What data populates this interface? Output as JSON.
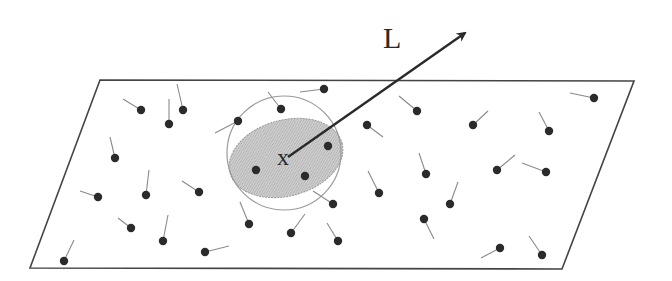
{
  "diagram": {
    "labels": {
      "vector": "L",
      "point": "x"
    },
    "colors": {
      "outline": "#444444",
      "dot": "#2b2b2b",
      "tail": "#8a8a8a",
      "circle": "#9a9a9a",
      "ellipse_fill": "#c4c4c4",
      "ellipse_stroke": "#9a9a9a",
      "arrow": "#2a2a2a"
    },
    "plane": {
      "points": [
        [
          100,
          80
        ],
        [
          634,
          81
        ],
        [
          562,
          269
        ],
        [
          30,
          268
        ]
      ]
    },
    "circle": {
      "cx": 284,
      "cy": 153,
      "r": 57
    },
    "ellipse": {
      "cx": 286,
      "cy": 158,
      "rx": 58,
      "ry": 38,
      "rotate": -15
    },
    "point_x": {
      "x": 288,
      "y": 158
    },
    "arrow": {
      "x1": 288,
      "y1": 157,
      "x2": 465,
      "y2": 33
    },
    "label_L_pos": {
      "x": 383,
      "y": 48
    },
    "label_x_pos": {
      "x": 277,
      "y": 165
    },
    "dipoles": [
      {
        "x": 141,
        "y": 110,
        "tx": 123,
        "ty": 99
      },
      {
        "x": 169,
        "y": 124,
        "tx": 169,
        "ty": 99
      },
      {
        "x": 183,
        "y": 110,
        "tx": 177,
        "ty": 84
      },
      {
        "x": 238,
        "y": 121,
        "tx": 215,
        "ty": 133
      },
      {
        "x": 281,
        "y": 109,
        "tx": 268,
        "ty": 92
      },
      {
        "x": 324,
        "y": 89,
        "tx": 300,
        "ty": 92
      },
      {
        "x": 115,
        "y": 158,
        "tx": 110,
        "ty": 137
      },
      {
        "x": 98,
        "y": 197,
        "tx": 80,
        "ty": 191
      },
      {
        "x": 146,
        "y": 195,
        "tx": 149,
        "ty": 170
      },
      {
        "x": 199,
        "y": 192,
        "tx": 182,
        "ty": 181
      },
      {
        "x": 131,
        "y": 228,
        "tx": 118,
        "ty": 218
      },
      {
        "x": 163,
        "y": 241,
        "tx": 168,
        "ty": 215
      },
      {
        "x": 205,
        "y": 252,
        "tx": 229,
        "ty": 246
      },
      {
        "x": 64,
        "y": 261,
        "tx": 74,
        "ty": 240
      },
      {
        "x": 256,
        "y": 170,
        "tx": 240,
        "ty": 155
      },
      {
        "x": 305,
        "y": 176,
        "tx": 300,
        "ty": 150
      },
      {
        "x": 328,
        "y": 146,
        "tx": 318,
        "ty": 127
      },
      {
        "x": 333,
        "y": 204,
        "tx": 313,
        "ty": 191
      },
      {
        "x": 249,
        "y": 224,
        "tx": 240,
        "ty": 202
      },
      {
        "x": 291,
        "y": 233,
        "tx": 305,
        "ty": 214
      },
      {
        "x": 338,
        "y": 241,
        "tx": 327,
        "ty": 223
      },
      {
        "x": 367,
        "y": 125,
        "tx": 383,
        "ty": 137
      },
      {
        "x": 417,
        "y": 111,
        "tx": 399,
        "ty": 96
      },
      {
        "x": 473,
        "y": 125,
        "tx": 488,
        "ty": 111
      },
      {
        "x": 549,
        "y": 131,
        "tx": 539,
        "ty": 112
      },
      {
        "x": 594,
        "y": 98,
        "tx": 570,
        "ty": 93
      },
      {
        "x": 379,
        "y": 193,
        "tx": 368,
        "ty": 171
      },
      {
        "x": 426,
        "y": 174,
        "tx": 419,
        "ty": 153
      },
      {
        "x": 450,
        "y": 204,
        "tx": 458,
        "ty": 182
      },
      {
        "x": 497,
        "y": 170,
        "tx": 515,
        "ty": 155
      },
      {
        "x": 546,
        "y": 172,
        "tx": 522,
        "ty": 163
      },
      {
        "x": 424,
        "y": 219,
        "tx": 434,
        "ty": 239
      },
      {
        "x": 500,
        "y": 248,
        "tx": 481,
        "ty": 258
      },
      {
        "x": 542,
        "y": 255,
        "tx": 529,
        "ty": 236
      }
    ]
  }
}
